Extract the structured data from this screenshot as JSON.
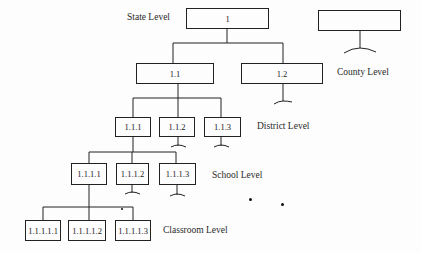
{
  "diagram": {
    "type": "hierarchy",
    "levels": {
      "state": "State Level",
      "county": "County Level",
      "district": "District Level",
      "school": "School Level",
      "classroom": "Classroom Level"
    },
    "nodes": {
      "n1": "1",
      "n1_1": "1.1",
      "n1_2": "1.2",
      "n1_1_1": "1.1.1",
      "n1_1_2": "1.1.2",
      "n1_1_3": "1.1.3",
      "n1_1_1_1": "1.1.1.1",
      "n1_1_1_2": "1.1.1.2",
      "n1_1_1_3": "1.1.1.3",
      "n1_1_1_1_1": "1.1.1.1.1",
      "n1_1_1_1_2": "1.1.1.1.2",
      "n1_1_1_1_3": "1.1.1.1.3",
      "other_state": ""
    },
    "edges": [
      [
        "1",
        "1.1"
      ],
      [
        "1",
        "1.2"
      ],
      [
        "1.1",
        "1.1.1"
      ],
      [
        "1.1",
        "1.1.2"
      ],
      [
        "1.1",
        "1.1.3"
      ],
      [
        "1.1.1",
        "1.1.1.1"
      ],
      [
        "1.1.1",
        "1.1.1.2"
      ],
      [
        "1.1.1",
        "1.1.1.3"
      ],
      [
        "1.1.1.1",
        "1.1.1.1.1"
      ],
      [
        "1.1.1.1",
        "1.1.1.1.2"
      ],
      [
        "1.1.1.1",
        "1.1.1.1.3"
      ]
    ],
    "colors": {
      "line": "#222222",
      "background": "#fdfdfd"
    }
  }
}
